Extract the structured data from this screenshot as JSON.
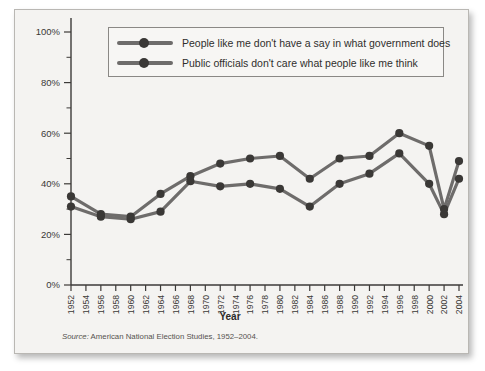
{
  "figure": {
    "axis_title_x": "Year",
    "source_label": "Source:",
    "source_text": " American National Election Studies, 1952–2004."
  },
  "legend": {
    "position": "top-inside",
    "entries": [
      {
        "label": "People like me don't have a say in what government does",
        "marker": "line-with-dot"
      },
      {
        "label": "Public officials don't care what people like me think",
        "marker": "line-with-dot"
      }
    ]
  },
  "chart_data": {
    "type": "line",
    "title": "",
    "xlabel": "Year",
    "ylabel": "",
    "ylim": [
      0,
      100
    ],
    "ytick_labels": [
      "0%",
      "20%",
      "40%",
      "60%",
      "80%",
      "100%"
    ],
    "ytick_values": [
      0,
      20,
      40,
      60,
      80,
      100
    ],
    "yminor_step": 10,
    "grid": false,
    "x": [
      1952,
      1954,
      1956,
      1958,
      1960,
      1962,
      1964,
      1966,
      1968,
      1970,
      1972,
      1974,
      1976,
      1978,
      1980,
      1982,
      1984,
      1986,
      1988,
      1990,
      1992,
      1994,
      1996,
      1998,
      2000,
      2002,
      2004
    ],
    "xtick_labels": [
      "1952",
      "1954",
      "1956",
      "1958",
      "1960",
      "1962",
      "1964",
      "1966",
      "1968",
      "1970",
      "1972",
      "1974",
      "1976",
      "1978",
      "1980",
      "1982",
      "1984",
      "1986",
      "1988",
      "1990",
      "1992",
      "1994",
      "1996",
      "1998",
      "2000",
      "2002",
      "2004"
    ],
    "series": [
      {
        "name": "People like me don't have a say in what government does",
        "points": [
          {
            "x": 1952,
            "y": 31
          },
          {
            "x": 1956,
            "y": 27
          },
          {
            "x": 1960,
            "y": 26
          },
          {
            "x": 1964,
            "y": 29
          },
          {
            "x": 1968,
            "y": 41
          },
          {
            "x": 1972,
            "y": 39
          },
          {
            "x": 1976,
            "y": 40
          },
          {
            "x": 1980,
            "y": 38
          },
          {
            "x": 1984,
            "y": 31
          },
          {
            "x": 1988,
            "y": 40
          },
          {
            "x": 1992,
            "y": 44
          },
          {
            "x": 1996,
            "y": 52
          },
          {
            "x": 2000,
            "y": 40
          },
          {
            "x": 2002,
            "y": 28
          },
          {
            "x": 2004,
            "y": 42
          }
        ]
      },
      {
        "name": "Public officials don't care what people like me think",
        "points": [
          {
            "x": 1952,
            "y": 35
          },
          {
            "x": 1956,
            "y": 28
          },
          {
            "x": 1960,
            "y": 27
          },
          {
            "x": 1964,
            "y": 36
          },
          {
            "x": 1968,
            "y": 43
          },
          {
            "x": 1972,
            "y": 48
          },
          {
            "x": 1976,
            "y": 50
          },
          {
            "x": 1980,
            "y": 51
          },
          {
            "x": 1984,
            "y": 42
          },
          {
            "x": 1988,
            "y": 50
          },
          {
            "x": 1992,
            "y": 51
          },
          {
            "x": 1996,
            "y": 60
          },
          {
            "x": 2000,
            "y": 55
          },
          {
            "x": 2002,
            "y": 30
          },
          {
            "x": 2004,
            "y": 49
          }
        ]
      }
    ]
  }
}
